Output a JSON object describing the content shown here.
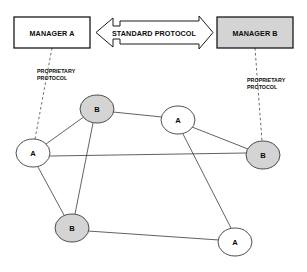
{
  "diagram": {
    "background_color": "#ffffff",
    "line_color": "#2b2b2b",
    "text_color": "#0b0b0b",
    "shaded_fill": "#d4d4d4",
    "plain_fill": "#ffffff"
  },
  "managers": [
    {
      "id": "manager-a",
      "label": "MANAGER A",
      "fill": "#ffffff",
      "x": 14,
      "y": 17,
      "w": 76,
      "h": 31
    },
    {
      "id": "manager-b",
      "label": "MANAGER B",
      "fill": "#d4d4d4",
      "x": 217,
      "y": 17,
      "w": 76,
      "h": 31
    }
  ],
  "standard_protocol": {
    "id": "standard-protocol-arrow",
    "label": "STANDARD PROTOCOL",
    "direction": "bidirectional",
    "fill": "#ffffff"
  },
  "proprietary_protocol_left": {
    "id": "proprietary-protocol-left",
    "line1": "PROPRIETARY",
    "line2": "PROTOCOL",
    "style": "dashed"
  },
  "proprietary_protocol_right": {
    "id": "proprietary-protocol-right",
    "line1": "PROPRIETARY",
    "line2": "PROTOCOL",
    "style": "dashed"
  },
  "nodes": [
    {
      "id": "node-b-top",
      "label": "B",
      "cx": 97,
      "cy": 109,
      "rx": 17,
      "ry": 14,
      "fill": "#d4d4d4"
    },
    {
      "id": "node-a-right-upper",
      "label": "A",
      "cx": 178,
      "cy": 120,
      "rx": 17,
      "ry": 14,
      "fill": "#ffffff"
    },
    {
      "id": "node-a-left",
      "label": "A",
      "cx": 33,
      "cy": 153,
      "rx": 17,
      "ry": 14,
      "fill": "#ffffff"
    },
    {
      "id": "node-b-right",
      "label": "B",
      "cx": 263,
      "cy": 155,
      "rx": 17,
      "ry": 14,
      "fill": "#d4d4d4"
    },
    {
      "id": "node-b-bottom-left",
      "label": "B",
      "cx": 72,
      "cy": 228,
      "rx": 17,
      "ry": 14,
      "fill": "#d4d4d4"
    },
    {
      "id": "node-a-bottom-right",
      "label": "A",
      "cx": 235,
      "cy": 242,
      "rx": 17,
      "ry": 14,
      "fill": "#ffffff"
    }
  ],
  "edges": [
    {
      "id": "edge-a-left--b-top",
      "from": "node-a-left",
      "to": "node-b-top"
    },
    {
      "id": "edge-b-top--a-right-upper",
      "from": "node-b-top",
      "to": "node-a-right-upper"
    },
    {
      "id": "edge-b-top--b-bottom-left",
      "from": "node-b-top",
      "to": "node-b-bottom-left"
    },
    {
      "id": "edge-a-left--b-right",
      "from": "node-a-left",
      "to": "node-b-right"
    },
    {
      "id": "edge-a-left--b-bottom-left",
      "from": "node-a-left",
      "to": "node-b-bottom-left"
    },
    {
      "id": "edge-a-right-upper--b-right",
      "from": "node-a-right-upper",
      "to": "node-b-right"
    },
    {
      "id": "edge-a-right-upper--a-bottom-right",
      "from": "node-a-right-upper",
      "to": "node-a-bottom-right"
    },
    {
      "id": "edge-b-bottom-left--a-bottom-right",
      "from": "node-b-bottom-left",
      "to": "node-a-bottom-right"
    }
  ],
  "dashed_links": [
    {
      "id": "dashed-link-manager-a",
      "x1": 52,
      "y1": 48,
      "x2": 35,
      "y2": 139
    },
    {
      "id": "dashed-link-manager-b",
      "x1": 255,
      "y1": 48,
      "x2": 262,
      "y2": 141
    }
  ]
}
